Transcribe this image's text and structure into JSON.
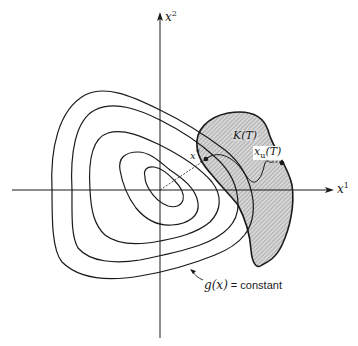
{
  "figure": {
    "type": "contour-diagram",
    "axes": {
      "x_label": "x",
      "x_label_sup": "1",
      "y_label": "x",
      "y_label_sup": "2"
    },
    "contours": {
      "count": 5,
      "label_main": "g(x)",
      "label_eq": " = constant"
    },
    "region": {
      "label": "K(T)",
      "fill": "hatched gray"
    },
    "points": {
      "optimum_label": "x",
      "optimum_sup": "*",
      "trajectory_end_label": "x",
      "trajectory_end_sub": "u",
      "trajectory_end_arg": "(T)"
    },
    "colors": {
      "stroke": "#1a1a1a",
      "region_fill": "#c8c8c8",
      "background": "#ffffff"
    }
  }
}
